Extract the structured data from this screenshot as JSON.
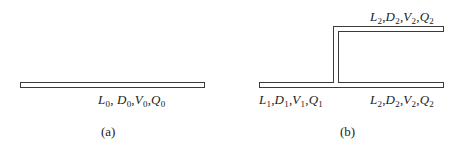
{
  "figure_a": {
    "caption": "(a)",
    "pipe": {
      "label_vars": [
        "L",
        "D",
        "V",
        "Q"
      ],
      "subscript": "0"
    }
  },
  "figure_b": {
    "caption": "(b)",
    "main_pipe_left": {
      "label_vars": [
        "L",
        "D",
        "V",
        "Q"
      ],
      "subscript": "1"
    },
    "main_pipe_right": {
      "label_vars": [
        "L",
        "D",
        "V",
        "Q"
      ],
      "subscript": "2"
    },
    "branch_pipe": {
      "label_vars": [
        "L",
        "D",
        "V",
        "Q"
      ],
      "subscript": "2"
    }
  },
  "separator": ","
}
